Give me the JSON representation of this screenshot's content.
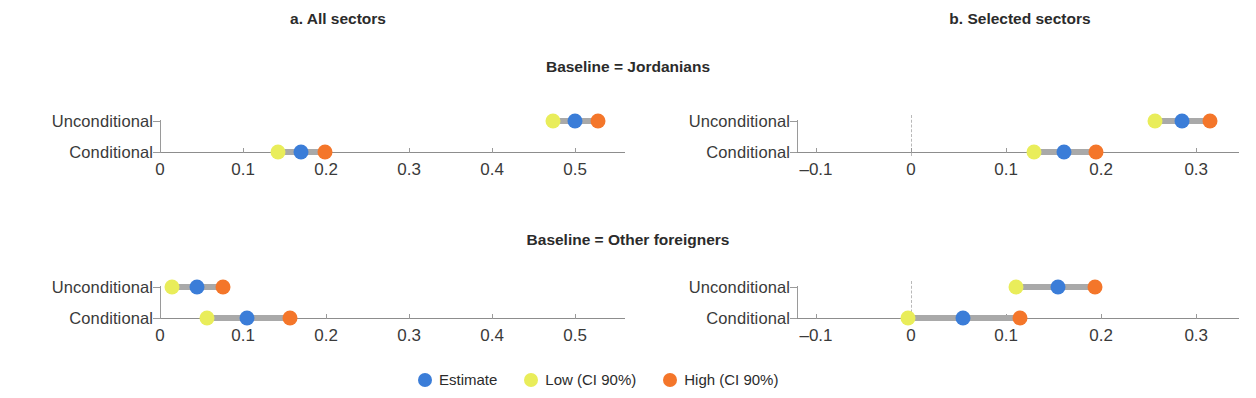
{
  "figure": {
    "panels": [
      {
        "id": "a",
        "label": "a. All sectors"
      },
      {
        "id": "b",
        "label": "b. Selected sectors"
      }
    ],
    "groups": [
      {
        "id": "jordanians",
        "label": "Baseline = Jordanians"
      },
      {
        "id": "other_foreigners",
        "label": "Baseline = Other foreigners"
      }
    ],
    "row_labels": [
      "Unconditional",
      "Conditional"
    ],
    "legend": [
      {
        "key": "estimate",
        "label": "Estimate",
        "color": "#3b7dd8"
      },
      {
        "key": "low",
        "label": "Low (CI 90%)",
        "color": "#e9ed5a"
      },
      {
        "key": "high",
        "label": "High (CI 90%)",
        "color": "#f4762a"
      }
    ],
    "colors": {
      "estimate": "#3b7dd8",
      "low": "#e9ed5a",
      "high": "#f4762a",
      "ci_bar": "#a9a9a9",
      "axis": "#8d8d8d",
      "zero_ref": "#b9b9b9",
      "text": "#2b2b2b"
    }
  },
  "chart_data": [
    {
      "type": "scatter",
      "id": "a-jordanians",
      "title": "a. All sectors",
      "subtitle": "Baseline = Jordanians",
      "xlabel": "",
      "ylabel": "",
      "xlim": [
        0,
        0.56
      ],
      "xticks": [
        0,
        0.1,
        0.2,
        0.3,
        0.4,
        0.5
      ],
      "xticklabels": [
        "0",
        "0.1",
        "0.2",
        "0.3",
        "0.4",
        "0.5"
      ],
      "grid": false,
      "zero_reference": false,
      "categories": [
        "Unconditional",
        "Conditional"
      ],
      "series": [
        {
          "name": "Estimate",
          "values": [
            0.5,
            0.17
          ]
        },
        {
          "name": "Low (CI 90%)",
          "values": [
            0.473,
            0.142
          ]
        },
        {
          "name": "High (CI 90%)",
          "values": [
            0.527,
            0.199
          ]
        }
      ]
    },
    {
      "type": "scatter",
      "id": "b-jordanians",
      "title": "b. Selected sectors",
      "subtitle": "Baseline = Jordanians",
      "xlabel": "",
      "ylabel": "",
      "xlim": [
        -0.12,
        0.345
      ],
      "xticks": [
        -0.1,
        0,
        0.1,
        0.2,
        0.3
      ],
      "xticklabels": [
        "–0.1",
        "0",
        "0.1",
        "0.2",
        "0.3"
      ],
      "grid": false,
      "zero_reference": true,
      "categories": [
        "Unconditional",
        "Conditional"
      ],
      "series": [
        {
          "name": "Estimate",
          "values": [
            0.285,
            0.161
          ]
        },
        {
          "name": "Low (CI 90%)",
          "values": [
            0.257,
            0.129
          ]
        },
        {
          "name": "High (CI 90%)",
          "values": [
            0.315,
            0.195
          ]
        }
      ]
    },
    {
      "type": "scatter",
      "id": "a-other-foreigners",
      "title": "a. All sectors",
      "subtitle": "Baseline = Other foreigners",
      "xlabel": "",
      "ylabel": "",
      "xlim": [
        0,
        0.56
      ],
      "xticks": [
        0,
        0.1,
        0.2,
        0.3,
        0.4,
        0.5
      ],
      "xticklabels": [
        "0",
        "0.1",
        "0.2",
        "0.3",
        "0.4",
        "0.5"
      ],
      "grid": false,
      "zero_reference": false,
      "categories": [
        "Unconditional",
        "Conditional"
      ],
      "series": [
        {
          "name": "Estimate",
          "values": [
            0.045,
            0.105
          ]
        },
        {
          "name": "Low (CI 90%)",
          "values": [
            0.014,
            0.057
          ]
        },
        {
          "name": "High (CI 90%)",
          "values": [
            0.076,
            0.157
          ]
        }
      ]
    },
    {
      "type": "scatter",
      "id": "b-other-foreigners",
      "title": "b. Selected sectors",
      "subtitle": "Baseline = Other foreigners",
      "xlabel": "",
      "ylabel": "",
      "xlim": [
        -0.12,
        0.345
      ],
      "xticks": [
        -0.1,
        0,
        0.1,
        0.2,
        0.3
      ],
      "xticklabels": [
        "–0.1",
        "0",
        "0.1",
        "0.2",
        "0.3"
      ],
      "grid": false,
      "zero_reference": true,
      "categories": [
        "Unconditional",
        "Conditional"
      ],
      "series": [
        {
          "name": "Estimate",
          "values": [
            0.155,
            0.055
          ]
        },
        {
          "name": "Low (CI 90%)",
          "values": [
            0.11,
            -0.003
          ]
        },
        {
          "name": "High (CI 90%)",
          "values": [
            0.193,
            0.115
          ]
        }
      ]
    }
  ]
}
